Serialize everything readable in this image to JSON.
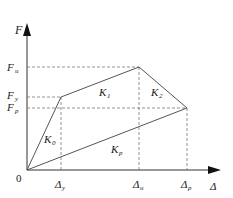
{
  "diagram": {
    "type": "force-displacement skeleton curve",
    "axes": {
      "y_label": "F",
      "x_label": "Δ",
      "origin_label": "0"
    },
    "y_ticks": [
      {
        "main": "F",
        "sub": "u"
      },
      {
        "main": "F",
        "sub": "y"
      },
      {
        "main": "F",
        "sub": "p"
      }
    ],
    "x_ticks": [
      {
        "main": "Δ",
        "sub": "y"
      },
      {
        "main": "Δ",
        "sub": "u"
      },
      {
        "main": "Δ",
        "sub": "p"
      }
    ],
    "segments": [
      {
        "main": "K",
        "sub": "0"
      },
      {
        "main": "K",
        "sub": "1"
      },
      {
        "main": "K",
        "sub": "2"
      },
      {
        "main": "K",
        "sub": "p"
      }
    ],
    "colors": {
      "axis": "#1a1a1a",
      "curve": "#555555",
      "dashed": "#777777"
    }
  }
}
